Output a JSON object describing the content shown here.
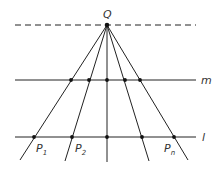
{
  "diagram": {
    "type": "perspective-projection",
    "apex": {
      "label": "Q",
      "x": 107,
      "y": 25
    },
    "horizon_line": {
      "style": "dashed",
      "y": 25,
      "x1": 15,
      "x2": 196
    },
    "line_m": {
      "label": "m",
      "y": 80,
      "x1": 15,
      "x2": 196,
      "points_x": [
        71,
        89,
        107,
        125,
        140
      ]
    },
    "line_l": {
      "label": "l",
      "y": 137,
      "x1": 15,
      "x2": 196,
      "points_x": [
        34,
        72,
        107,
        142,
        174
      ]
    },
    "rays_end": [
      {
        "x": 20,
        "y": 160
      },
      {
        "x": 65,
        "y": 161
      },
      {
        "x": 107,
        "y": 162
      },
      {
        "x": 149,
        "y": 161
      },
      {
        "x": 188,
        "y": 160
      }
    ],
    "point_labels": [
      {
        "base": "P",
        "sub": "1",
        "x": 36,
        "y": 152
      },
      {
        "base": "P",
        "sub": "2",
        "x": 75,
        "y": 152
      },
      {
        "base": "P",
        "sub": "n",
        "x": 165,
        "y": 152
      }
    ],
    "colors": {
      "line": "#222222",
      "text": "#333333",
      "background": "#ffffff"
    }
  }
}
